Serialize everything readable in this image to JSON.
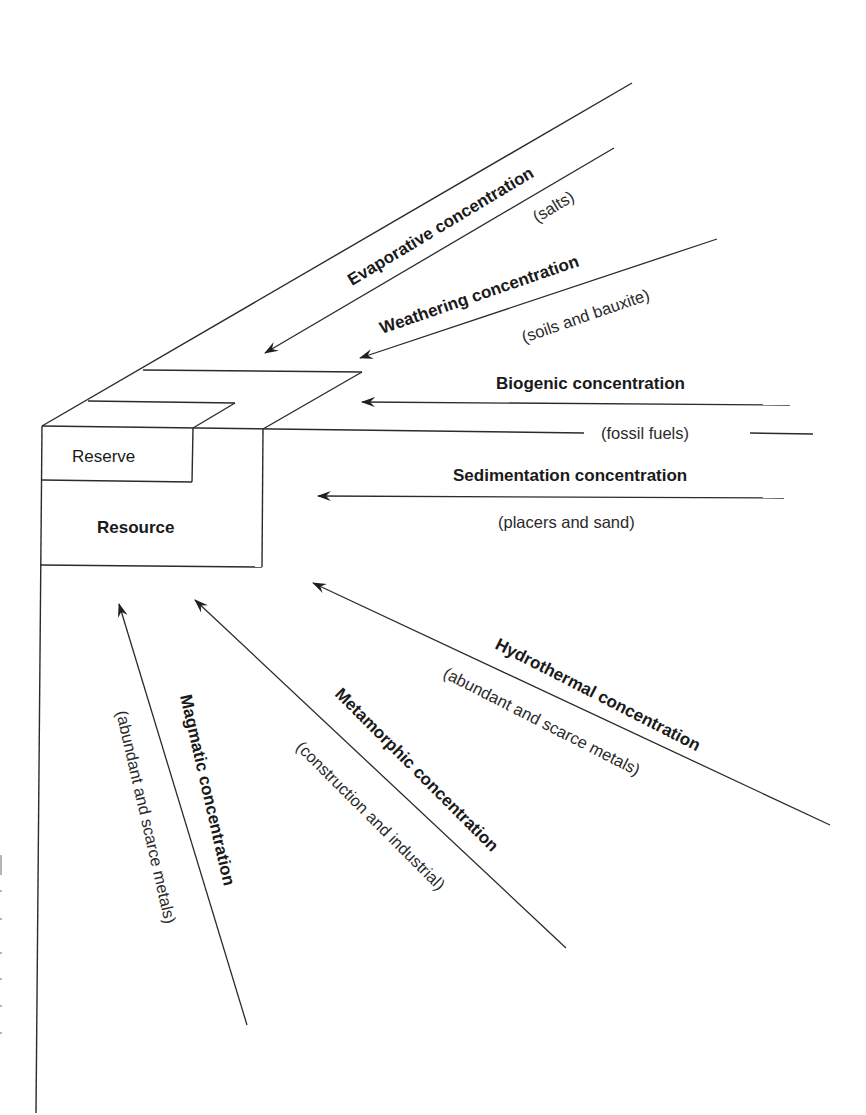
{
  "diagram": {
    "box": {
      "reserve_label": "Reserve",
      "resource_label": "Resource"
    },
    "processes": [
      {
        "id": "evaporative",
        "label": "Evaporative concentration",
        "examples": "(salts)"
      },
      {
        "id": "weathering",
        "label": "Weathering concentration",
        "examples": "(soils and bauxite)"
      },
      {
        "id": "biogenic",
        "label": "Biogenic concentration",
        "examples": "(fossil fuels)"
      },
      {
        "id": "sedimentation",
        "label": "Sedimentation concentration",
        "examples": "(placers and sand)"
      },
      {
        "id": "hydrothermal",
        "label": "Hydrothermal concentration",
        "examples": "(abundant and scarce metals)"
      },
      {
        "id": "metamorphic",
        "label": "Metamorphic concentration",
        "examples": "(construction and industrial)"
      },
      {
        "id": "magmatic",
        "label": "Magmatic concentration",
        "examples": "(abundant and scarce metals)"
      }
    ],
    "colors": {
      "line": "#2b2b2b",
      "text": "#1a1a1a",
      "background": "#ffffff"
    }
  }
}
